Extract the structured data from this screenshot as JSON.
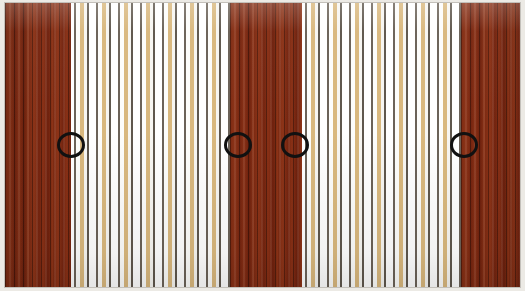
{
  "image": {
    "title": "Annotated striped panel photograph",
    "width": 525,
    "height": 291,
    "subject": "vertical striped wooden wall panel",
    "border_color": "#eceae5"
  },
  "palette": {
    "dark_red": "#7d2a12",
    "dark_red_highlight": "#8f3517",
    "dark_red_shadow": "#6d200d",
    "stripe_white": "#ffffff",
    "stripe_tan": "#d9b87e",
    "stripe_gray": "#6b6258",
    "annotation": "#111111"
  },
  "panel": {
    "x": 5,
    "y": 3,
    "width": 515,
    "height": 284,
    "bands": [
      {
        "name": "dark-band-left",
        "type": "dark",
        "x": 0,
        "width": 66,
        "label": "Dark mahogany band (left)"
      },
      {
        "name": "light-band-one",
        "type": "light",
        "x": 66,
        "width": 159,
        "label": "Light striped band (first)"
      },
      {
        "name": "dark-band-middle",
        "type": "dark",
        "x": 225,
        "width": 72,
        "label": "Dark mahogany band (middle)"
      },
      {
        "name": "light-band-two",
        "type": "light",
        "x": 297,
        "width": 159,
        "label": "Light striped band (second)"
      },
      {
        "name": "dark-band-right",
        "type": "dark",
        "x": 456,
        "width": 59,
        "label": "Dark mahogany band (right)"
      }
    ]
  },
  "annotations": {
    "shape": "ellipse",
    "stroke_color": "#111111",
    "stroke_width": 3,
    "count": 4,
    "markers": [
      {
        "id": "marker-1",
        "cx": 71,
        "cy": 145,
        "rx": 14,
        "ry": 13,
        "label": "Boundary: dark band left to light band one"
      },
      {
        "id": "marker-2",
        "cx": 238,
        "cy": 145,
        "rx": 14,
        "ry": 13,
        "label": "Boundary: light band one to dark band middle"
      },
      {
        "id": "marker-3",
        "cx": 295,
        "cy": 145,
        "rx": 14,
        "ry": 13,
        "label": "Boundary: dark band middle to light band two"
      },
      {
        "id": "marker-4",
        "cx": 464,
        "cy": 145,
        "rx": 14,
        "ry": 13,
        "label": "Boundary: light band two to dark band right"
      }
    ]
  },
  "caption": {
    "text": ""
  }
}
